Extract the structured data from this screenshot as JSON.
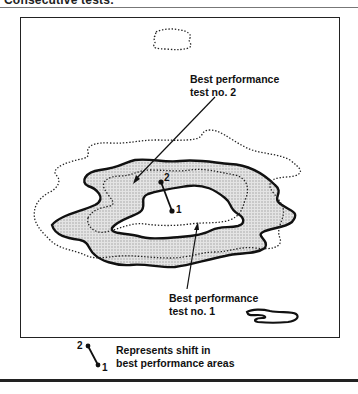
{
  "figure": {
    "heading": "Consecutive tests:",
    "labels": {
      "test2_line1": "Best performance",
      "test2_line2": "test no. 2",
      "test1_line1": "Best performance",
      "test1_line2": "test no. 1"
    },
    "points": {
      "point2": "2",
      "point1": "1"
    },
    "legend": {
      "point2": "2",
      "point1": "1",
      "line1": "Represents shift in",
      "line2": "best performance areas"
    },
    "styles": {
      "test1_contour": "solid",
      "test2_contour": "dotted",
      "shading": "#cfcfcf"
    }
  }
}
